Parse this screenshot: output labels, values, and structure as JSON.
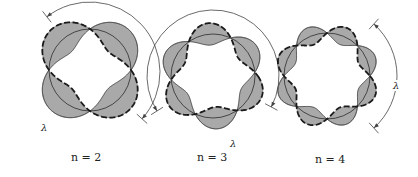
{
  "figure": {
    "colors": {
      "fill": "#a9a9a9",
      "stroke": "#1a1a1a",
      "arc": "#444444",
      "background": "#ffffff"
    }
  },
  "diagrams": [
    {
      "n": 2,
      "label": "n = 2",
      "label_pos": [
        71,
        151
      ],
      "center": [
        90,
        70
      ],
      "radius": 41,
      "amplitude": 15,
      "phase_deg": 0,
      "lambda_label": "λ",
      "lambda_arc": {
        "center": [
          90,
          72
        ],
        "radius": 70,
        "start_deg": 232,
        "end_deg": 42,
        "label_pos": [
          40,
          122
        ]
      }
    },
    {
      "n": 3,
      "label": "n = 3",
      "label_pos": [
        197,
        151
      ],
      "center": [
        213,
        76
      ],
      "radius": 42,
      "amplitude": 11,
      "phase_deg": 15,
      "lambda_label": "λ",
      "lambda_arc": {
        "center": [
          213,
          76
        ],
        "radius": 66,
        "start_deg": 148,
        "end_deg": 28,
        "label_pos": [
          229,
          138
        ]
      }
    },
    {
      "n": 4,
      "label": "n = 4",
      "label_pos": [
        315,
        153
      ],
      "center": [
        327,
        76
      ],
      "radius": 43,
      "amplitude": 9,
      "phase_deg": 0,
      "lambda_label": "λ",
      "lambda_arc": {
        "center": [
          327,
          76
        ],
        "radius": 70,
        "start_deg": -48,
        "end_deg": 48,
        "label_pos": [
          392,
          80
        ]
      }
    }
  ]
}
